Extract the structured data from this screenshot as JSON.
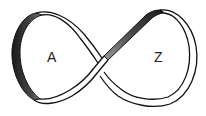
{
  "diagram": {
    "type": "figure-eight twisted band (Möbius strip)",
    "labels": {
      "left_loop": "A",
      "right_loop": "Z"
    },
    "colors": {
      "background": "#ffffff",
      "outline": "#111111",
      "band_front": "#ffffff",
      "band_back_shade": "#3a3a3a",
      "label_text": "#222222"
    }
  }
}
